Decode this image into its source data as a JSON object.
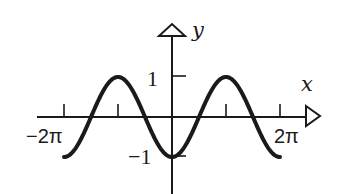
{
  "chart_data": {
    "type": "line",
    "title": "",
    "function": "y = -cos(x)",
    "xlabel": "x",
    "ylabel": "y",
    "xlim": [
      -6.2832,
      6.2832
    ],
    "ylim": [
      -1,
      1
    ],
    "grid": false,
    "legend": null,
    "x_ticks": [
      -6.2832,
      -3.1416,
      0,
      3.1416,
      6.2832
    ],
    "x_tick_labels": [
      "−2π",
      "",
      "",
      "",
      "2π"
    ],
    "y_ticks": [
      1,
      -1
    ],
    "y_tick_labels": [
      "1",
      "−1"
    ],
    "series": [
      {
        "name": "-cos(x)",
        "x": [
          -6.2832,
          -4.7124,
          -3.1416,
          -1.5708,
          0,
          1.5708,
          3.1416,
          4.7124,
          6.2832
        ],
        "values": [
          -1,
          0,
          1,
          0,
          -1,
          0,
          1,
          0,
          -1
        ]
      }
    ],
    "stroke_color": "#1a1a1a"
  },
  "labels": {
    "x_axis": "x",
    "y_axis": "y",
    "y_one": "1",
    "y_neg_one": "−1",
    "x_neg_two_pi": "−2π",
    "x_two_pi": "2π"
  }
}
